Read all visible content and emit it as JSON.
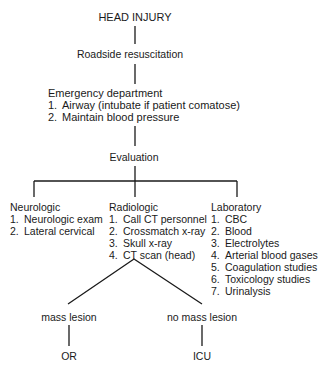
{
  "diagram": {
    "root": "HEAD INJURY",
    "step1": "Roadside resuscitation",
    "emergency": {
      "title": "Emergency department",
      "items": [
        {
          "num": "1.",
          "text": "Airway (intubate if patient comatose)"
        },
        {
          "num": "2.",
          "text": "Maintain blood pressure"
        }
      ]
    },
    "evaluation": "Evaluation",
    "branches": [
      {
        "title": "Neurologic",
        "items": [
          {
            "num": "1.",
            "text": "Neurologic exam"
          },
          {
            "num": "2.",
            "text": "Lateral cervical"
          }
        ]
      },
      {
        "title": "Radiologic",
        "items": [
          {
            "num": "1.",
            "text": "Call CT personnel"
          },
          {
            "num": "2.",
            "text": "Crossmatch x-ray"
          },
          {
            "num": "3.",
            "text": "Skull x-ray"
          },
          {
            "num": "4.",
            "text": "CT scan (head)"
          }
        ]
      },
      {
        "title": "Laboratory",
        "items": [
          {
            "num": "1.",
            "text": "CBC"
          },
          {
            "num": "2.",
            "text": "Blood"
          },
          {
            "num": "3.",
            "text": "Electrolytes"
          },
          {
            "num": "4.",
            "text": "Arterial blood gases"
          },
          {
            "num": "5.",
            "text": "Coagulation studies"
          },
          {
            "num": "6.",
            "text": "Toxicology studies"
          },
          {
            "num": "7.",
            "text": "Urinalysis"
          }
        ]
      }
    ],
    "outcomes": [
      {
        "condition": "mass lesion",
        "destination": "OR"
      },
      {
        "condition": "no mass lesion",
        "destination": "ICU"
      }
    ]
  }
}
